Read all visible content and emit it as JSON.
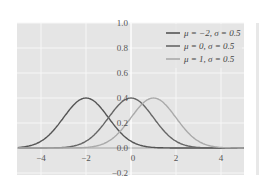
{
  "chart_data": {
    "type": "line",
    "title": "",
    "xlabel": "",
    "ylabel": "",
    "xlim": [
      -5,
      5
    ],
    "ylim": [
      -0.2,
      1.0
    ],
    "grid": true,
    "legend_position": "upper right",
    "x_ticks": [
      "-4",
      "-2",
      "0",
      "2",
      "4"
    ],
    "y_ticks": [
      "-0.2",
      "0.0",
      "0.2",
      "0.4",
      "0.6",
      "0.8",
      "1.0"
    ],
    "series": [
      {
        "name": "μ = −2, σ = 0.5",
        "mu": -2,
        "peak": 0.4,
        "color": "#555555"
      },
      {
        "name": "μ = 0, σ = 0.5",
        "mu": 0,
        "peak": 0.4,
        "color": "#666666"
      },
      {
        "name": "μ = 1, σ = 0.5",
        "mu": 1,
        "peak": 0.4,
        "color": "#aaaaaa"
      }
    ]
  },
  "colors": {
    "plot_bg": "#e5e5e5",
    "grid": "#f7f7f7",
    "second_panel_bg": "#e8e8e8"
  }
}
